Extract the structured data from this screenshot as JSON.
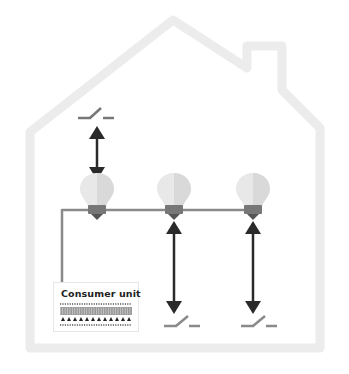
{
  "diagram": {
    "consumer_unit": {
      "label": "Consumer unit"
    },
    "bulbs": [
      {
        "id": "bulb-1",
        "x": 97
      },
      {
        "id": "bulb-2",
        "x": 174
      },
      {
        "id": "bulb-3",
        "x": 253
      }
    ],
    "switches": [
      {
        "id": "switch-1",
        "position": "above bulb 1"
      },
      {
        "id": "switch-2",
        "position": "below bulb 2"
      },
      {
        "id": "switch-3",
        "position": "below bulb 3"
      }
    ],
    "colors": {
      "house_outline": "#ececec",
      "wire": "#8a8a8a",
      "arrow": "#2a2a2a",
      "bulb_light": "#e8e8e8",
      "bulb_shade": "#d6d6d6",
      "bulb_base": "#777777",
      "switch": "#8a8a8a"
    }
  }
}
